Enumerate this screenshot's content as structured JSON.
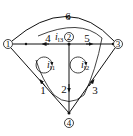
{
  "diagram": {
    "type": "circuit-graph",
    "nodes": [
      {
        "id": "1",
        "label": "1",
        "x": 8,
        "y": 44
      },
      {
        "id": "2",
        "label": "2",
        "x": 69,
        "y": 37
      },
      {
        "id": "3",
        "label": "3",
        "x": 118,
        "y": 44
      },
      {
        "id": "4",
        "label": "4",
        "x": 69,
        "y": 123
      }
    ],
    "branches": [
      {
        "id": "1",
        "label": "1",
        "from": "4",
        "to": "1"
      },
      {
        "id": "2",
        "label": "2",
        "from": "2",
        "to": "4"
      },
      {
        "id": "3",
        "label": "3",
        "from": "4",
        "to": "3"
      },
      {
        "id": "4",
        "label": "4",
        "from": "2",
        "to": "1"
      },
      {
        "id": "5",
        "label": "5",
        "from": "2",
        "to": "3"
      },
      {
        "id": "6",
        "label": "6",
        "from": "3",
        "to": "1"
      }
    ],
    "loops": [
      {
        "id": "i11",
        "label": "i",
        "sub": "l1"
      },
      {
        "id": "i12",
        "label": "i",
        "sub": "l2"
      },
      {
        "id": "i13",
        "label": "i",
        "sub": "l3"
      }
    ]
  }
}
